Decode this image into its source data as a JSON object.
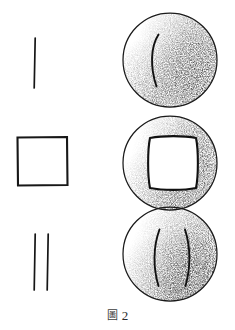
{
  "figure": {
    "title": "圖 2",
    "caption_glyph": "圖",
    "caption_number": "2",
    "background_color": "#ffffff",
    "ink_color": "#1a1a1a",
    "stipple_color": "#4a4a4a",
    "width": 235,
    "height": 330
  },
  "rows": [
    {
      "id": "row-1",
      "symbol": {
        "name": "single-vertical-stroke",
        "type": "line",
        "stroke_count": 1,
        "cx": 35,
        "cy": 62,
        "lines": [
          {
            "x1": 35,
            "y1": 38,
            "x2": 34,
            "y2": 88
          }
        ]
      },
      "sphere": {
        "name": "sphere-single-line",
        "cx": 170,
        "cy": 60,
        "r": 47,
        "marks": [
          {
            "type": "arc",
            "d": "M 158 35 C 150 48 150 68 156 86"
          }
        ],
        "shading": "right-and-lower-right"
      }
    },
    {
      "id": "row-2",
      "symbol": {
        "name": "square-outline",
        "type": "square",
        "stroke_count": 4,
        "x": 17,
        "y": 137,
        "w": 50,
        "h": 48
      },
      "sphere": {
        "name": "sphere-inscribed-square",
        "cx": 170,
        "cy": 163,
        "r": 47,
        "marks": [
          {
            "type": "rounded-square",
            "x": 145,
            "y": 135,
            "w": 55,
            "h": 55
          }
        ],
        "shading": "right-and-lower-left"
      }
    },
    {
      "id": "row-3",
      "symbol": {
        "name": "double-vertical-stroke",
        "type": "line",
        "stroke_count": 2,
        "cx": 41,
        "cy": 262,
        "lines": [
          {
            "x1": 35,
            "y1": 234,
            "x2": 34,
            "y2": 290
          },
          {
            "x1": 48,
            "y1": 234,
            "x2": 47,
            "y2": 290
          }
        ]
      },
      "sphere": {
        "name": "sphere-double-line",
        "cx": 170,
        "cy": 254,
        "r": 47,
        "marks": [
          {
            "type": "arc",
            "d": "M 159 230 C 153 248 153 268 158 286"
          },
          {
            "type": "arc",
            "d": "M 185 230 C 190 248 190 268 186 286"
          }
        ],
        "shading": "right-and-lower-right"
      }
    }
  ]
}
